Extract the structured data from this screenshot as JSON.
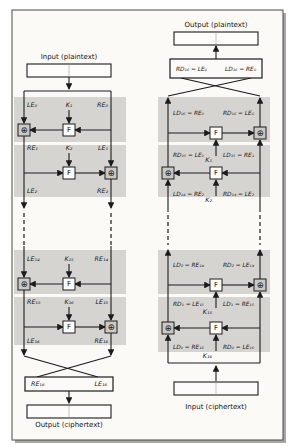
{
  "figure": {
    "encryption": {
      "input_label": "Input (plaintext)",
      "output_label": "Output (ciphertext)",
      "round1": {
        "left": "LE₀",
        "key": "K₁",
        "right": "RE₀"
      },
      "round2": {
        "left": "RE₁",
        "key": "K₂",
        "right": "LE₁"
      },
      "round2_out": {
        "left": "LE₂",
        "right": "RE₂"
      },
      "round15": {
        "left": "LE₁₄",
        "key": "K₁₅",
        "right": "RE₁₄"
      },
      "round16": {
        "left": "RE₁₅",
        "key": "K₁₆",
        "right": "LE₁₅"
      },
      "round16_out": {
        "left": "LE₁₆",
        "right": "RE₁₆"
      },
      "swap_box": {
        "left": "RE₁₆",
        "right": "LE₁₆"
      }
    },
    "decryption": {
      "output_label": "Output (plaintext)",
      "input_label": "Input (ciphertext)",
      "swap_box": {
        "left": "RD₁₆ = LE₀",
        "right": "LD₁₆ = RE₀"
      },
      "round1_top": {
        "left": "LD₁₆ = RE₀",
        "right": "RD₁₆ = LE₀"
      },
      "round1_bottom": {
        "left": "RD₁₅ = LE₁",
        "key": "K₁",
        "right": "LD₁₅ = RE₁"
      },
      "round2_bottom": {
        "left": "LD₁₄ = RE₂",
        "key": "K₂",
        "right": "RD₁₄ = LE₂"
      },
      "round15_top": {
        "left": "LD₂ = RE₁₄",
        "right": "RD₂ = LE₁₄"
      },
      "round15_bottom": {
        "left": "RD₁ = LE₁₅",
        "key": "K₁₅",
        "right": "LD₁ = RE₁₅"
      },
      "round16_bottom": {
        "left": "LD₀ = RE₁₆",
        "key": "K₁₆",
        "right": "RD₀ = LE₁₆"
      }
    },
    "symbols": {
      "f_function": "F",
      "xor": "⊕"
    },
    "colors": {
      "round_shade": "#d6d4d0",
      "line": "#1c1c1c",
      "xor_fill": "#cbc9c5",
      "paper": "#fbfaf6",
      "frame_shadow": "#a9a7a3"
    }
  }
}
